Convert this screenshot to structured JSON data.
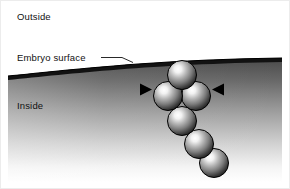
{
  "figure": {
    "width": 290,
    "height": 189,
    "background_color": "#ffffff",
    "border_color": "#e8e8e8",
    "labels": {
      "outside": "Outside",
      "embryo_surface": "Embryo surface",
      "inside": "Inside"
    },
    "label_color": "#111111",
    "surface": {
      "name": "embryo-surface-curve",
      "stroke_color": "#0a0a0a",
      "fill_color": "#141414",
      "description": "dark curved band representing the embryo surface"
    },
    "leader_line": {
      "name": "embryo-surface-leader",
      "color": "#111111"
    },
    "interior_gradient": {
      "top_color": "#4a4a4a",
      "bottom_color": "#ffffff",
      "description": "inside of embryo shaded dark near surface fading to white"
    },
    "spheres": [
      {
        "id": "sphere-1",
        "cx": 182,
        "cy": 75,
        "r": 14.5
      },
      {
        "id": "sphere-2",
        "cx": 168,
        "cy": 96,
        "r": 14.5
      },
      {
        "id": "sphere-3",
        "cx": 196,
        "cy": 96,
        "r": 14.5
      },
      {
        "id": "sphere-4",
        "cx": 182,
        "cy": 121,
        "r": 14.5
      },
      {
        "id": "sphere-5",
        "cx": 199,
        "cy": 144,
        "r": 14.5
      },
      {
        "id": "sphere-6",
        "cx": 214,
        "cy": 163,
        "r": 14.5
      }
    ],
    "sphere_style": {
      "highlight_color": "#ffffff",
      "mid_color": "#9a9a9a",
      "shadow_color": "#1a1a1a",
      "outline_color": "#000000"
    },
    "arrowheads": [
      {
        "id": "arrowhead-left",
        "direction": "right",
        "x": 141,
        "y": 89
      },
      {
        "id": "arrowhead-right",
        "direction": "left",
        "x": 223,
        "y": 89
      }
    ],
    "arrowhead_color": "#000000"
  }
}
